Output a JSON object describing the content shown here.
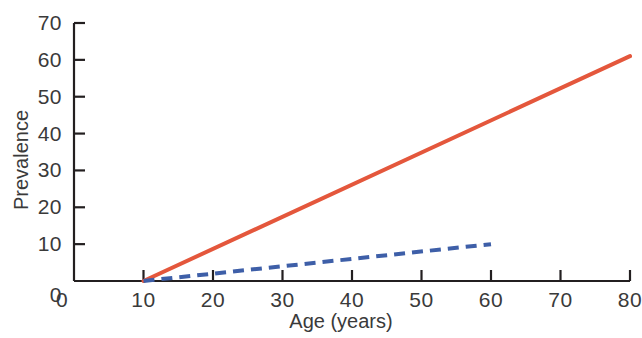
{
  "chart_data": {
    "type": "line",
    "title": "",
    "xlabel": "Age (years)",
    "ylabel": "Prevalence",
    "xlim": [
      0,
      80
    ],
    "ylim": [
      0,
      70
    ],
    "xticks": [
      0,
      10,
      20,
      30,
      40,
      50,
      60,
      70,
      80
    ],
    "xtick_labels": [
      "0",
      "10",
      "20",
      "30",
      "40",
      "50",
      "60",
      "70",
      "80"
    ],
    "yticks": [
      0,
      10,
      20,
      30,
      40,
      50,
      60,
      70
    ],
    "ytick_labels": [
      "0",
      "10",
      "20",
      "30",
      "40",
      "50",
      "60",
      "70"
    ],
    "grid": false,
    "legend": "none",
    "series": [
      {
        "name": "solid-red-line",
        "style": "solid",
        "color": "#E4573C",
        "linewidth": 4,
        "x": [
          10,
          80
        ],
        "values": [
          0,
          61
        ]
      },
      {
        "name": "dashed-blue-line",
        "style": "dashed",
        "color": "#3E5FA8",
        "linewidth": 4,
        "x": [
          10,
          60
        ],
        "values": [
          0,
          10
        ]
      }
    ]
  },
  "axes": {
    "ylabel_text": "Prevalence",
    "xlabel_text": "Age (years)"
  }
}
